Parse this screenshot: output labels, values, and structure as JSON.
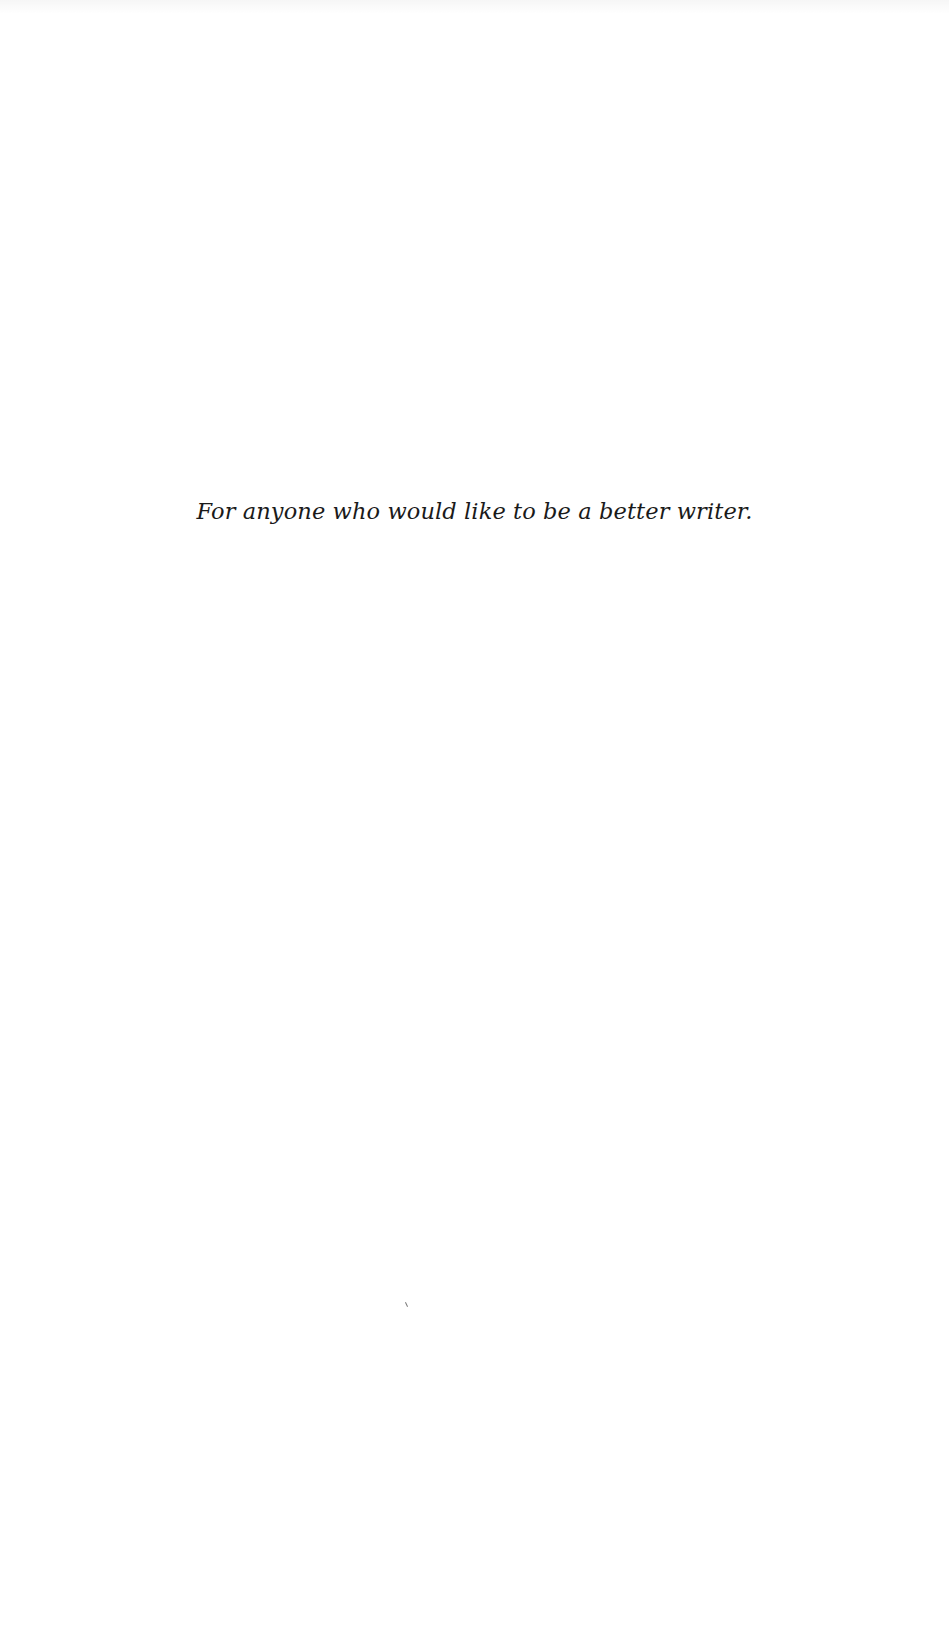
{
  "page": {
    "type": "dedication",
    "dedication_text": "For anyone who would like to be a better writer."
  }
}
